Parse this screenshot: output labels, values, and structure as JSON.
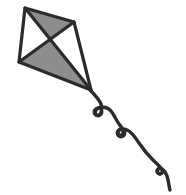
{
  "canvas": {
    "width": 186,
    "height": 195,
    "background": "#ffffff",
    "title": "Kite line drawing"
  },
  "artwork": {
    "subject": "kite",
    "style": "flat line-art clipart",
    "outline_color": "#2b2b2b",
    "fill_gray": "#8d8d8d",
    "fill_white": "#ffffff",
    "outline_width": 3.2,
    "tail_width": 3.4
  },
  "kite": {
    "name": "diamond-kite",
    "vertices": {
      "top": {
        "x": 25,
        "y": 8
      },
      "right": {
        "x": 74,
        "y": 22
      },
      "bottom": {
        "x": 91,
        "y": 90
      },
      "left": {
        "x": 19,
        "y": 62
      }
    },
    "center": {
      "x": 50,
      "y": 41
    },
    "outline_path": "M25,8 L74,22 L91,90 L19,62 Z",
    "panels": [
      {
        "name": "panel-upper-left",
        "fill": "#ffffff",
        "path": "M25,8 L50,41 L19,62 Z"
      },
      {
        "name": "panel-upper-right",
        "fill": "#8d8d8d",
        "path": "M25,8 L74,22 L50,41 Z"
      },
      {
        "name": "panel-lower-right",
        "fill": "#ffffff",
        "path": "M74,22 L91,90 L50,41 Z"
      },
      {
        "name": "panel-lower-left",
        "fill": "#8d8d8d",
        "path": "M19,62 L50,41 L91,90 Z"
      }
    ],
    "spars": [
      {
        "name": "spar-vertical",
        "path": "M25,8 L91,90"
      },
      {
        "name": "spar-horizontal",
        "path": "M74,22 L19,62"
      }
    ]
  },
  "tail": {
    "name": "kite-tail",
    "color": "#2b2b2b",
    "loop_count": 3,
    "ribbon_path": "M90,90 C95,95 99,99 101,104 C103,109 101,114 99,115 C96,116 94,113 96,110 C99,106 106,106 110,110 C114,114 116,120 119,124 C122,128 124,130 123,133 C122,136 118,136 118,133 C118,129 123,128 127,130 C132,132 135,137 139,143 C143,149 148,155 153,160 C157,164 161,167 162,170 C163,173 160,175 158,173 C156,171 158,168 161,169 C165,170 167,175 168,180 C169,184 169,187 170,190",
    "loops": [
      {
        "name": "tail-loop-1",
        "x": 98,
        "y": 112,
        "r": 4
      },
      {
        "name": "tail-loop-2",
        "x": 121,
        "y": 133,
        "r": 4
      },
      {
        "name": "tail-loop-3",
        "x": 160,
        "y": 171,
        "r": 3
      }
    ],
    "end_point": {
      "x": 170,
      "y": 190
    }
  }
}
